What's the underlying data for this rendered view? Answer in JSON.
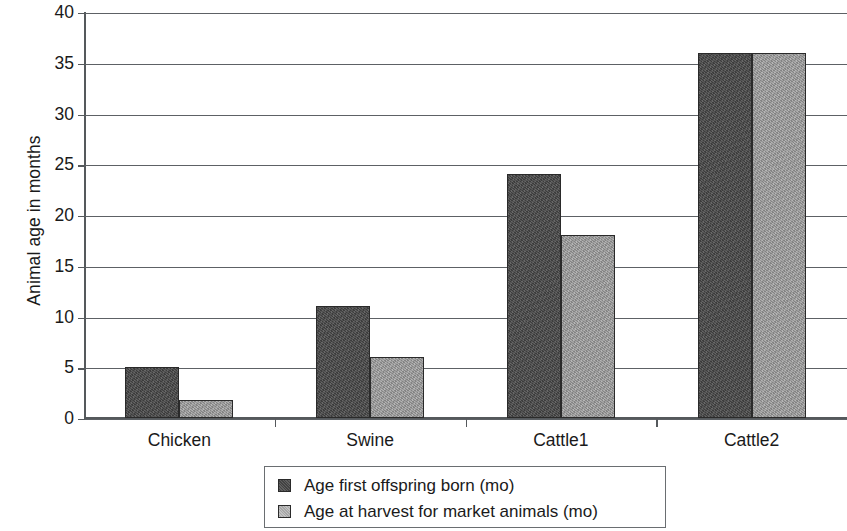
{
  "chart_data": {
    "type": "bar",
    "title": "",
    "xlabel": "",
    "ylabel": "Animal age in months",
    "categories": [
      "Chicken",
      "Swine",
      "Cattle1",
      "Cattle2"
    ],
    "series": [
      {
        "name": "Age first offspring born (mo)",
        "color": "#4a4a4a",
        "values": [
          5,
          11,
          24,
          36
        ]
      },
      {
        "name": "Age at harvest for market animals (mo)",
        "color": "#9e9e9e",
        "values": [
          1.8,
          6,
          18,
          36
        ]
      }
    ],
    "ylim": [
      0,
      40
    ],
    "ytick_interval": 5,
    "yticks": [
      40,
      35,
      30,
      25,
      20,
      15,
      10,
      5,
      0
    ],
    "ytick_labels": [
      "40",
      "35",
      "30",
      "25",
      "20",
      "15",
      "10",
      "5",
      "0"
    ],
    "grid": "horizontal",
    "legend_position": "bottom-center",
    "bar_style": "grouped"
  }
}
